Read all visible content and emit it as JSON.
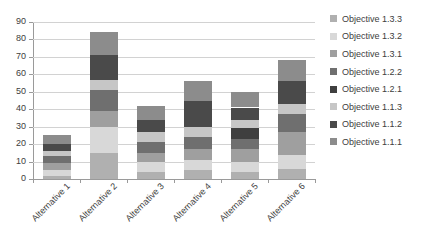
{
  "chart_data": {
    "type": "bar",
    "stacked": true,
    "title": "",
    "xlabel": "",
    "ylabel": "",
    "ylim": [
      0,
      90
    ],
    "ytick_step": 10,
    "yticks": [
      0,
      10,
      20,
      30,
      40,
      50,
      60,
      70,
      80,
      90
    ],
    "grid": true,
    "legend_position": "right",
    "categories": [
      "Alternative 1",
      "Alternative 2",
      "Alternative 3",
      "Alternative 4",
      "Alternative 5",
      "Alternative 6"
    ],
    "series": [
      {
        "name": "Objective 1.1.1",
        "color": "#8c8c8c",
        "values": [
          5,
          13,
          8,
          11,
          9,
          12
        ]
      },
      {
        "name": "Objective 1.1.2",
        "color": "#4a4a4a",
        "values": [
          4,
          14,
          7,
          15,
          7,
          13
        ]
      },
      {
        "name": "Objective 1.1.3",
        "color": "#c6c6c6",
        "values": [
          3,
          6,
          6,
          6,
          5,
          6
        ]
      },
      {
        "name": "Objective 1.2.1",
        "color": "#3f3f3f",
        "values": [
          0,
          0,
          0,
          0,
          6,
          0
        ]
      },
      {
        "name": "Objective 1.2.2",
        "color": "#6f6f6f",
        "values": [
          4,
          12,
          6,
          7,
          6,
          10
        ]
      },
      {
        "name": "Objective 1.3.1",
        "color": "#9f9f9f",
        "values": [
          4,
          9,
          5,
          6,
          7,
          13
        ]
      },
      {
        "name": "Objective 1.3.2",
        "color": "#d8d8d8",
        "values": [
          3,
          15,
          6,
          6,
          6,
          8
        ]
      },
      {
        "name": "Objective 1.3.3",
        "color": "#b0b0b0",
        "values": [
          2,
          15,
          4,
          5,
          4,
          6
        ]
      }
    ],
    "totals": [
      25,
      84,
      42,
      56,
      50,
      68
    ]
  },
  "legend": {
    "items": [
      {
        "label": "Objective 1.3.3",
        "color": "#b0b0b0"
      },
      {
        "label": "Objective 1.3.2",
        "color": "#d8d8d8"
      },
      {
        "label": "Objective 1.3.1",
        "color": "#9f9f9f"
      },
      {
        "label": "Objective 1.2.2",
        "color": "#6f6f6f"
      },
      {
        "label": "Objective 1.2.1",
        "color": "#3f3f3f"
      },
      {
        "label": "Objective 1.1.3",
        "color": "#c6c6c6"
      },
      {
        "label": "Objective 1.1.2",
        "color": "#4a4a4a"
      },
      {
        "label": "Objective 1.1.1",
        "color": "#8c8c8c"
      }
    ]
  }
}
